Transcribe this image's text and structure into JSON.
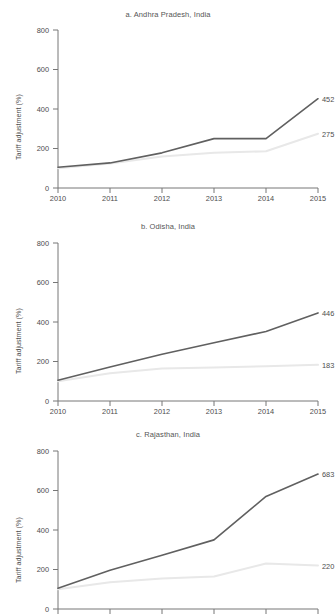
{
  "figure": {
    "truncated_header": "· · ·",
    "ylabel": "Tariff adjustment (%)",
    "colors": {
      "series_dark": "#606060",
      "series_light": "#e8e8e8",
      "axis": "#777777",
      "text": "#4d4d4d"
    }
  },
  "panels": [
    {
      "title": "a. Andhra Pradesh, India",
      "ylabel": "Tariff adjustment (%)",
      "end_labels": {
        "dark": "452",
        "light": "275"
      },
      "xticks": [
        "2010",
        "2011",
        "2012",
        "2013",
        "2014",
        "2015"
      ],
      "yticks": [
        "0",
        "200",
        "400",
        "600",
        "800"
      ]
    },
    {
      "title": "b. Odisha, India",
      "ylabel": "Tariff adjustment (%)",
      "end_labels": {
        "dark": "446",
        "light": "183"
      },
      "xticks": [
        "2010",
        "2011",
        "2012",
        "2013",
        "2014",
        "2015"
      ],
      "yticks": [
        "0",
        "200",
        "400",
        "600",
        "800"
      ]
    },
    {
      "title": "c. Rajasthan, India",
      "ylabel": "Tariff adjustment (%)",
      "end_labels": {
        "dark": "683",
        "light": "220"
      },
      "xticks": [],
      "yticks": [
        "0",
        "200",
        "400",
        "600",
        "800"
      ]
    }
  ],
  "chart_data": [
    {
      "type": "line",
      "title": "a. Andhra Pradesh, India",
      "xlabel": "",
      "ylabel": "Tariff adjustment (%)",
      "x": [
        2010,
        2011,
        2012,
        2013,
        2014,
        2015
      ],
      "xlim": [
        2010,
        2015
      ],
      "ylim": [
        0,
        800
      ],
      "ytick_values": [
        0,
        200,
        400,
        600,
        800
      ],
      "grid": false,
      "legend": "none",
      "series": [
        {
          "name": "dark-series",
          "color": "#606060",
          "values": [
            105,
            127,
            178,
            250,
            250,
            452
          ],
          "end_label": 452
        },
        {
          "name": "light-series",
          "color": "#e8e8e8",
          "values": [
            100,
            124,
            160,
            178,
            186,
            275
          ],
          "end_label": 275
        }
      ]
    },
    {
      "type": "line",
      "title": "b. Odisha, India",
      "xlabel": "",
      "ylabel": "Tariff adjustment (%)",
      "x": [
        2010,
        2011,
        2012,
        2013,
        2014,
        2015
      ],
      "xlim": [
        2010,
        2015
      ],
      "ylim": [
        0,
        800
      ],
      "ytick_values": [
        0,
        200,
        400,
        600,
        800
      ],
      "grid": false,
      "legend": "none",
      "series": [
        {
          "name": "dark-series",
          "color": "#606060",
          "values": [
            105,
            172,
            237,
            295,
            352,
            446
          ],
          "end_label": 446
        },
        {
          "name": "light-series",
          "color": "#e8e8e8",
          "values": [
            100,
            140,
            164,
            170,
            176,
            183
          ],
          "end_label": 183
        }
      ]
    },
    {
      "type": "line",
      "title": "c. Rajasthan, India",
      "xlabel": "",
      "ylabel": "Tariff adjustment (%)",
      "x": [
        2010,
        2011,
        2012,
        2013,
        2014,
        2015
      ],
      "xlim": [
        2010,
        2015
      ],
      "ylim": [
        0,
        800
      ],
      "ytick_values": [
        0,
        200,
        400,
        600,
        800
      ],
      "grid": false,
      "legend": "none",
      "series": [
        {
          "name": "dark-series",
          "color": "#606060",
          "values": [
            105,
            196,
            272,
            350,
            570,
            683
          ],
          "end_label": 683
        },
        {
          "name": "light-series",
          "color": "#e8e8e8",
          "values": [
            100,
            136,
            155,
            165,
            230,
            220
          ],
          "end_label": 220
        }
      ]
    }
  ]
}
